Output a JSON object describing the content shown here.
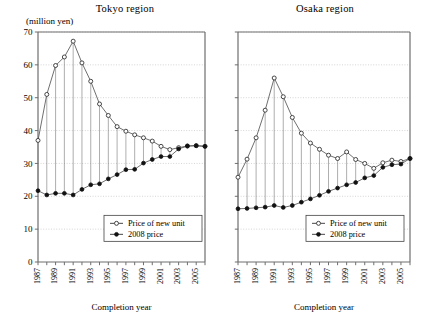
{
  "figure": {
    "unit_label": "(million yen)",
    "xaxis_title": "Completion year"
  },
  "legend": {
    "series_open_label": "Price of new unit",
    "series_filled_label": "2008 price"
  },
  "chart_data": [
    {
      "type": "line",
      "title": "Tokyo region",
      "xlabel": "Completion year",
      "ylabel": "(million yen)",
      "ylim": [
        0,
        70
      ],
      "yticks": [
        0,
        10,
        20,
        30,
        40,
        50,
        60,
        70
      ],
      "ytick_labels": [
        "0",
        "10",
        "20",
        "30",
        "40",
        "50",
        "60",
        "70"
      ],
      "grid": true,
      "legend_position": "bottom-center",
      "x": [
        1987,
        1988,
        1989,
        1990,
        1991,
        1992,
        1993,
        1994,
        1995,
        1996,
        1997,
        1998,
        1999,
        2000,
        2001,
        2002,
        2003,
        2004,
        2005,
        2006
      ],
      "xtick_labels": [
        "1987",
        "",
        "1989",
        "",
        "1991",
        "",
        "1993",
        "",
        "1995",
        "",
        "1997",
        "",
        "1999",
        "",
        "2001",
        "",
        "2003",
        "",
        "2005",
        ""
      ],
      "series": [
        {
          "name": "Price of new unit",
          "marker": "open-circle",
          "values": [
            37.0,
            51.0,
            59.8,
            62.4,
            67.2,
            60.6,
            55.0,
            48.1,
            44.6,
            41.2,
            39.8,
            38.7,
            37.8,
            36.8,
            35.2,
            34.2,
            34.8,
            35.3,
            35.4,
            35.2
          ]
        },
        {
          "name": "2008 price",
          "marker": "filled-circle",
          "values": [
            21.7,
            20.4,
            20.9,
            20.9,
            20.4,
            22.1,
            23.5,
            23.8,
            25.3,
            26.6,
            28.1,
            28.2,
            30.1,
            31.2,
            32.1,
            32.1,
            34.4,
            35.3,
            35.4,
            35.2
          ]
        }
      ]
    },
    {
      "type": "line",
      "title": "Osaka region",
      "xlabel": "Completion year",
      "ylabel": "(million yen)",
      "ylim": [
        0,
        70
      ],
      "yticks": [
        0,
        10,
        20,
        30,
        40,
        50,
        60,
        70
      ],
      "ytick_labels": [
        "",
        "",
        "",
        "",
        "",
        "",
        "",
        ""
      ],
      "grid": true,
      "legend_position": "bottom-center",
      "x": [
        1987,
        1988,
        1989,
        1990,
        1991,
        1992,
        1993,
        1994,
        1995,
        1996,
        1997,
        1998,
        1999,
        2000,
        2001,
        2002,
        2003,
        2004,
        2005,
        2006
      ],
      "xtick_labels": [
        "1987",
        "",
        "1989",
        "",
        "1991",
        "",
        "1993",
        "",
        "1995",
        "",
        "1997",
        "",
        "1999",
        "",
        "2001",
        "",
        "2003",
        "",
        "2005",
        ""
      ],
      "series": [
        {
          "name": "Price of new unit",
          "marker": "open-circle",
          "values": [
            25.8,
            31.3,
            37.8,
            46.2,
            56.0,
            50.3,
            44.0,
            39.2,
            36.2,
            34.3,
            32.5,
            31.5,
            33.5,
            31.2,
            30.0,
            28.5,
            30.2,
            31.0,
            30.6,
            31.5
          ]
        },
        {
          "name": "2008 price",
          "marker": "filled-circle",
          "values": [
            16.2,
            16.3,
            16.5,
            16.7,
            17.2,
            16.6,
            17.2,
            18.2,
            19.2,
            20.3,
            21.5,
            22.5,
            23.5,
            24.2,
            25.6,
            26.3,
            28.8,
            29.6,
            29.8,
            31.5
          ]
        }
      ]
    }
  ]
}
